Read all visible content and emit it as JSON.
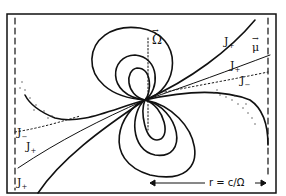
{
  "diagram": {
    "type": "pulsar magnetosphere sketch",
    "labels": {
      "omega": "Ω",
      "mu": "μ",
      "j_plus": "J",
      "j_minus": "J",
      "plus_sub": "+",
      "minus_sub": "−",
      "light_cylinder": "r = c/Ω"
    },
    "colors": {
      "ink": "#111111",
      "background": "#ffffff"
    }
  }
}
